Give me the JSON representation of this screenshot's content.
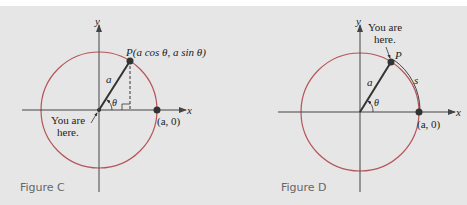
{
  "figures": [
    {
      "caption": "Figure C",
      "axis_x_label": "x",
      "axis_y_label": "y",
      "point_label": "P(a cos θ, a sin θ)",
      "radius_label": "a",
      "angle_label": "θ",
      "start_point_label": "(a, 0)",
      "you_are_here_line1": "You are",
      "you_are_here_line2": "here."
    },
    {
      "caption": "Figure D",
      "axis_x_label": "x",
      "axis_y_label": "y",
      "point_label": "P",
      "radius_label": "a",
      "angle_label": "θ",
      "arc_label": "s",
      "start_point_label": "(a, 0)",
      "you_are_here_line1": "You are",
      "you_are_here_line2": "here."
    }
  ],
  "colors": {
    "background": "#e6e6e6",
    "circle": "#b5555a",
    "axes": "#444444",
    "point": "#333333",
    "caption": "#666666"
  }
}
